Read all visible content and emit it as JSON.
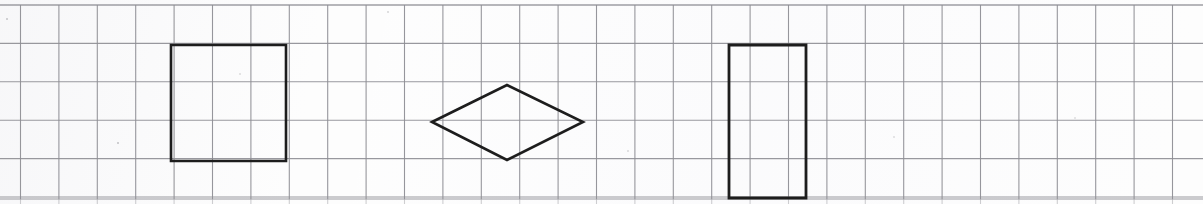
{
  "page": {
    "title": "Geometry worksheet grid with drawn shapes",
    "width": 1203,
    "height": 204,
    "background_color": "#fdfdfd"
  },
  "grid": {
    "name": "squared-graph-paper",
    "line_color": "#8e8e94",
    "line_width": 1.1,
    "cell_size": 38.4,
    "origin_x": 20.5,
    "origin_y": 5.0,
    "columns": 30,
    "rows": 5,
    "right_edge_x": 1172,
    "bottom_edge_y": 199
  },
  "shapes": [
    {
      "id": "square",
      "name": "square-shape",
      "label": "Square",
      "type": "polygon",
      "stroke_color": "#1d1d1d",
      "stroke_width": 2.6,
      "fill": "none",
      "grid_span": "3 by 3 cells",
      "points": "171,45 286,45 286,161 171,161"
    },
    {
      "id": "rhombus",
      "name": "rhombus-shape",
      "label": "Rhombus",
      "type": "polygon",
      "stroke_color": "#1d1d1d",
      "stroke_width": 2.6,
      "fill": "none",
      "grid_span": "4 by 2 cells",
      "points": "432,122 507,85 583,122 507,160"
    },
    {
      "id": "rectangle",
      "name": "rectangle-shape",
      "label": "Rectangle",
      "type": "polygon",
      "stroke_color": "#1d1d1d",
      "stroke_width": 2.8,
      "fill": "none",
      "grid_span": "2 by 4 cells",
      "points": "729,45 806,45 806,198 729,198"
    }
  ],
  "specks": [
    {
      "name": "scan-speck",
      "x": 7,
      "y": 19,
      "size": 2.6,
      "opacity": 0.55
    },
    {
      "name": "scan-speck",
      "x": 118,
      "y": 143,
      "size": 2.8,
      "opacity": 0.6
    },
    {
      "name": "scan-speck",
      "x": 388,
      "y": 12,
      "size": 2.0,
      "opacity": 0.4
    },
    {
      "name": "scan-speck",
      "x": 628,
      "y": 151,
      "size": 1.8,
      "opacity": 0.35
    },
    {
      "name": "scan-speck",
      "x": 1075,
      "y": 118,
      "size": 1.8,
      "opacity": 0.3
    },
    {
      "name": "scan-speck",
      "x": 240,
      "y": 74,
      "size": 1.6,
      "opacity": 0.3
    },
    {
      "name": "scan-speck",
      "x": 894,
      "y": 137,
      "size": 1.6,
      "opacity": 0.28
    }
  ]
}
